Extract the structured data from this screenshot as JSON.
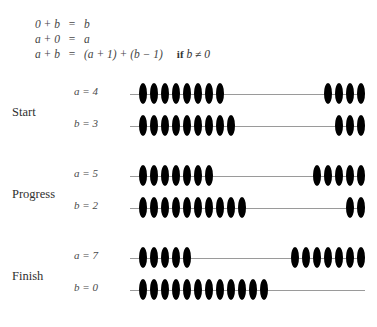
{
  "equations": [
    {
      "lhs": "0 + b",
      "eq": "=",
      "rhs": "b",
      "cond": ""
    },
    {
      "lhs": "a + 0",
      "eq": "=",
      "rhs": "a",
      "cond": ""
    },
    {
      "lhs": "a + b",
      "eq": "=",
      "rhs": "(a + 1) + (b − 1)",
      "cond_kw": "if",
      "cond": "b ≠ 0"
    }
  ],
  "stages": [
    {
      "label": "Start",
      "rods": [
        {
          "label": "a = 4",
          "var": "a",
          "value": 4,
          "left_beads": 8,
          "right_beads": 4,
          "total_beads": 12
        },
        {
          "label": "b = 3",
          "var": "b",
          "value": 3,
          "left_beads": 9,
          "right_beads": 3,
          "total_beads": 12
        }
      ]
    },
    {
      "label": "Progress",
      "rods": [
        {
          "label": "a = 5",
          "var": "a",
          "value": 5,
          "left_beads": 7,
          "right_beads": 5,
          "total_beads": 12
        },
        {
          "label": "b = 2",
          "var": "b",
          "value": 2,
          "left_beads": 10,
          "right_beads": 2,
          "total_beads": 12
        }
      ]
    },
    {
      "label": "Finish",
      "rods": [
        {
          "label": "a = 7",
          "var": "a",
          "value": 7,
          "left_beads": 5,
          "right_beads": 7,
          "total_beads": 12
        },
        {
          "label": "b = 0",
          "var": "b",
          "value": 0,
          "left_beads": 12,
          "right_beads": 0,
          "total_beads": 12
        }
      ]
    }
  ],
  "geometry": {
    "rod_width": 235,
    "bead_spacing": 11,
    "bead_width": 8,
    "left_start": 9,
    "right_end": 227
  },
  "colors": {
    "bead": "#000000",
    "rod": "#9a9a9a",
    "text": "#3a3a3a",
    "background": "#ffffff"
  }
}
